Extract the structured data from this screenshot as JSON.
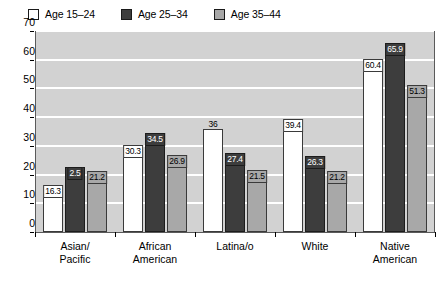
{
  "chart_data": {
    "type": "bar",
    "title": "",
    "subtitle": "",
    "xlabel": "",
    "ylabel": "",
    "ylim": [
      0,
      70
    ],
    "yticks": [
      0,
      10,
      20,
      30,
      40,
      50,
      60,
      70
    ],
    "grid": true,
    "legend_position": "top-left",
    "categories": [
      [
        "Asian/",
        "Pacific"
      ],
      [
        "African",
        "American"
      ],
      [
        "Latina/o",
        ""
      ],
      [
        "White",
        ""
      ],
      [
        "Native",
        "American"
      ]
    ],
    "series": [
      {
        "name": "Age 15–24",
        "color": "#ffffff",
        "values": [
          16.3,
          30.3,
          36,
          39.4,
          60.4
        ],
        "labels": [
          "16.3",
          "30.3",
          "36",
          "39.4",
          "60.4"
        ],
        "label_outside": [
          false,
          false,
          true,
          false,
          false
        ]
      },
      {
        "name": "Age 25–34",
        "color": "#3d3d3d",
        "values": [
          22.5,
          34.5,
          27.4,
          26.3,
          65.9
        ],
        "labels": [
          "2.5",
          "34.5",
          "27.4",
          "26.3",
          "65.9"
        ],
        "label_outside": [
          false,
          false,
          false,
          false,
          false
        ]
      },
      {
        "name": "Age 35–44",
        "color": "#a8a8a8",
        "values": [
          21.2,
          26.9,
          21.5,
          21.2,
          51.3
        ],
        "labels": [
          "21.2",
          "26.9",
          "21.5",
          "21.2",
          "51.3"
        ],
        "label_outside": [
          false,
          false,
          false,
          false,
          false
        ]
      }
    ]
  },
  "plot": {
    "background_color": "#d2d2d2",
    "gridline_color": "#ffffff",
    "border_color": "#5a5a5a"
  }
}
